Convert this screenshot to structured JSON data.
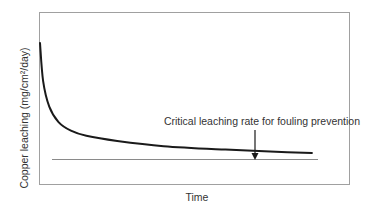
{
  "chart_data": {
    "type": "line",
    "title": "",
    "xlabel": "Time",
    "ylabel": "Copper leaching (mg/cm²/day)",
    "x_ticks": [],
    "y_ticks": [],
    "grid": false,
    "legend": null,
    "series": [
      {
        "name": "Copper leaching rate",
        "style": "thick dark curve",
        "x": [
          0,
          0.01,
          0.03,
          0.06,
          0.1,
          0.15,
          0.25,
          0.4,
          0.6,
          0.8,
          0.88
        ],
        "y": [
          0.82,
          0.6,
          0.45,
          0.36,
          0.31,
          0.28,
          0.25,
          0.22,
          0.2,
          0.185,
          0.18
        ]
      }
    ],
    "reference_lines": [
      {
        "name": "Critical leaching rate for fouling prevention",
        "orientation": "horizontal",
        "y": 0.15,
        "x_range": [
          0.04,
          0.9
        ]
      }
    ],
    "annotations": [
      {
        "text": "Critical leaching rate for fouling prevention",
        "arrow_to": {
          "x": 0.7,
          "y": 0.15
        }
      }
    ],
    "axis_units": "relative (no numeric ticks shown)",
    "xlim": [
      0,
      1
    ],
    "ylim": [
      0,
      1
    ]
  },
  "labels": {
    "xlabel": "Time",
    "ylabel": "Copper leaching (mg/cm²/day)",
    "annotation": "Critical leaching rate for fouling prevention"
  },
  "colors": {
    "curve": "#1a1a1a",
    "frame": "#9a9a9a",
    "threshold": "#8a8a8a",
    "text": "#333333"
  }
}
